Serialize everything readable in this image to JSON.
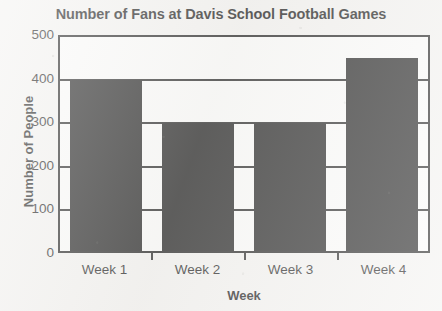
{
  "chart_data": {
    "type": "bar",
    "title": "Number of Fans at Davis School Football Games",
    "xlabel": "Week",
    "ylabel": "Number of People",
    "categories": [
      "Week 1",
      "Week 2",
      "Week 3",
      "Week 4"
    ],
    "values": [
      400,
      300,
      300,
      450
    ],
    "ylim": [
      0,
      500
    ],
    "ytick_labels": [
      "500",
      "400",
      "300",
      "200",
      "100",
      "0"
    ],
    "ytick_values": [
      500,
      400,
      300,
      200,
      100,
      0
    ],
    "grid": true,
    "legend": false,
    "bar_color": "#121212",
    "axis_color": "#1a1a1a",
    "background_color": "#f3f2f0"
  }
}
